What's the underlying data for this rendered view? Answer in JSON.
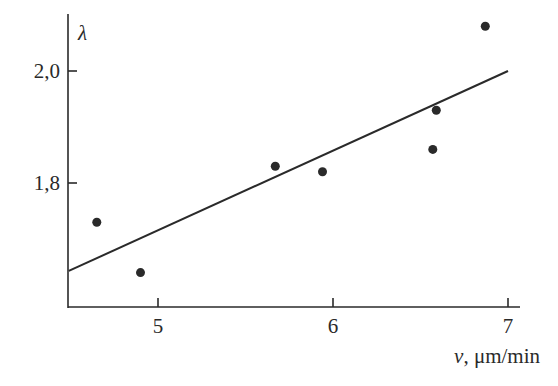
{
  "chart_data": {
    "type": "scatter",
    "title": "",
    "xlabel_var": "v",
    "xlabel_unit": ", μm/min",
    "xlabel": "v, μm/min",
    "ylabel": "λ",
    "xlim": [
      4.49,
      7.07
    ],
    "ylim": [
      1.57,
      2.09
    ],
    "grid": false,
    "legend": null,
    "x_ticks": [
      {
        "value": 5,
        "label": "5"
      },
      {
        "value": 6,
        "label": "6"
      },
      {
        "value": 7,
        "label": "7"
      }
    ],
    "y_ticks": [
      {
        "value": 1.8,
        "label": "1,8"
      },
      {
        "value": 2.0,
        "label": "2,0"
      }
    ],
    "series": [
      {
        "name": "measurements",
        "kind": "scatter",
        "points": [
          {
            "x": 4.65,
            "y": 1.73
          },
          {
            "x": 4.9,
            "y": 1.64
          },
          {
            "x": 5.67,
            "y": 1.83
          },
          {
            "x": 5.94,
            "y": 1.82
          },
          {
            "x": 6.57,
            "y": 1.86
          },
          {
            "x": 6.59,
            "y": 1.93
          },
          {
            "x": 6.87,
            "y": 2.08
          }
        ]
      },
      {
        "name": "linear fit",
        "kind": "line",
        "points": [
          {
            "x": 4.49,
            "y": 1.643
          },
          {
            "x": 7.0,
            "y": 2.0
          }
        ]
      }
    ]
  },
  "colors": {
    "ink": "#2a2a2a",
    "background": "#ffffff"
  }
}
